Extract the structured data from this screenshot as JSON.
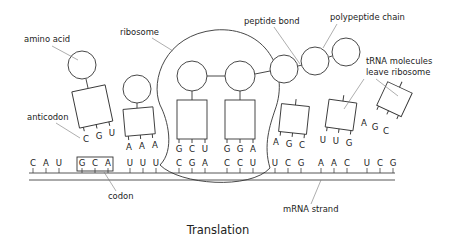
{
  "diagram": {
    "title": "Translation",
    "labels": {
      "amino_acid": "amino acid",
      "ribosome": "ribosome",
      "peptide_bond": "peptide bond",
      "polypeptide_chain": "polypeptide chain",
      "trna_leave_line1": "tRNA molecules",
      "trna_leave_line2": "leave ribosome",
      "anticodon": "anticodon",
      "codon": "codon",
      "mrna_strand": "mRNA strand"
    },
    "mrna_codons": [
      {
        "bases": [
          "C",
          "A",
          "U"
        ]
      },
      {
        "bases": [
          "G",
          "C",
          "A"
        ],
        "boxed": true
      },
      {
        "bases": [
          "U",
          "U",
          "U"
        ]
      },
      {
        "bases": [
          "C",
          "G",
          "A"
        ]
      },
      {
        "bases": [
          "C",
          "C",
          "U"
        ]
      },
      {
        "bases": [
          "U",
          "C",
          "G"
        ]
      },
      {
        "bases": [
          "A",
          "A",
          "C"
        ]
      },
      {
        "bases": [
          "U",
          "C",
          "G"
        ]
      }
    ],
    "trna_molecules": [
      {
        "id": "trna-1",
        "anticodon": [
          "C",
          "G",
          "U"
        ],
        "state": "arriving"
      },
      {
        "id": "trna-2",
        "anticodon": [
          "A",
          "A",
          "A"
        ],
        "state": "arriving"
      },
      {
        "id": "trna-3",
        "anticodon": [
          "G",
          "C",
          "U"
        ],
        "state": "in-ribosome"
      },
      {
        "id": "trna-4",
        "anticodon": [
          "G",
          "G",
          "A"
        ],
        "state": "in-ribosome"
      },
      {
        "id": "trna-5",
        "anticodon": [
          "A",
          "G",
          "C"
        ],
        "state": "leaving"
      },
      {
        "id": "trna-6",
        "anticodon": [
          "U",
          "U",
          "G"
        ],
        "state": "leaving"
      },
      {
        "id": "trna-7",
        "anticodon": [
          "A",
          "G",
          "C"
        ],
        "state": "leaving"
      }
    ]
  }
}
